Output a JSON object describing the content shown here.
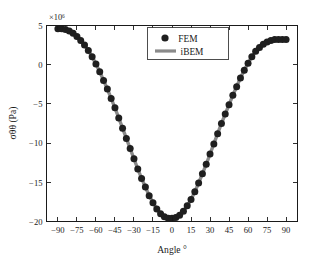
{
  "chart_data": {
    "type": "line",
    "title": "",
    "subtitle": "",
    "xlabel": "Angle °",
    "ylabel": "σθθ (Pa)",
    "y_exponent_label": "×10⁶",
    "y_scale_factor": 1000000,
    "grid": false,
    "legend_position": "upper-center",
    "xlim": [
      -99,
      99
    ],
    "ylim": [
      -20,
      5
    ],
    "xticks": [
      -90,
      -75,
      -60,
      -45,
      -30,
      -15,
      0,
      15,
      30,
      45,
      60,
      75,
      90
    ],
    "xtick_labels": [
      "−90",
      "−75",
      "−60",
      "−45",
      "−30",
      "−15",
      "0",
      "15",
      "30",
      "45",
      "60",
      "75",
      "90"
    ],
    "yticks": [
      5,
      0,
      -5,
      -10,
      -15,
      -20
    ],
    "ytick_labels": [
      "5",
      "0",
      "−5",
      "−10",
      "−15",
      "−20"
    ],
    "series": [
      {
        "name": "FEM",
        "style": "markers",
        "marker": "filled-circle",
        "color": "#1f1f1f",
        "x": [
          -90,
          -87,
          -84,
          -81,
          -78,
          -75,
          -72,
          -69,
          -66,
          -63,
          -60,
          -57,
          -54,
          -51,
          -48,
          -45,
          -42,
          -39,
          -36,
          -33,
          -30,
          -27,
          -24,
          -21,
          -18,
          -15,
          -12,
          -9,
          -6,
          -3,
          0,
          3,
          6,
          9,
          12,
          15,
          18,
          21,
          24,
          27,
          30,
          33,
          36,
          39,
          42,
          45,
          48,
          51,
          54,
          57,
          60,
          63,
          66,
          69,
          72,
          75,
          78,
          81,
          84,
          87,
          90
        ],
        "y": [
          4.6,
          4.6,
          4.5,
          4.3,
          4.0,
          3.6,
          3.1,
          2.5,
          1.8,
          1.0,
          0.1,
          -0.9,
          -2.0,
          -3.1,
          -4.3,
          -5.5,
          -6.8,
          -8.1,
          -9.4,
          -10.7,
          -12.0,
          -13.3,
          -14.5,
          -15.6,
          -16.7,
          -17.6,
          -18.4,
          -19.0,
          -19.4,
          -19.6,
          -19.6,
          -19.5,
          -19.2,
          -18.7,
          -18.0,
          -17.2,
          -16.2,
          -15.1,
          -13.9,
          -12.7,
          -11.4,
          -10.1,
          -8.8,
          -7.5,
          -6.3,
          -5.1,
          -3.9,
          -2.8,
          -1.7,
          -0.7,
          0.2,
          1.0,
          1.7,
          2.2,
          2.6,
          2.9,
          3.1,
          3.2,
          3.2,
          3.2,
          3.2
        ]
      },
      {
        "name": "iBEM",
        "style": "line",
        "color": "#8a8a8a",
        "x": [
          -90,
          -87,
          -84,
          -81,
          -78,
          -75,
          -72,
          -69,
          -66,
          -63,
          -60,
          -57,
          -54,
          -51,
          -48,
          -45,
          -42,
          -39,
          -36,
          -33,
          -30,
          -27,
          -24,
          -21,
          -18,
          -15,
          -12,
          -9,
          -6,
          -3,
          0,
          3,
          6,
          9,
          12,
          15,
          18,
          21,
          24,
          27,
          30,
          33,
          36,
          39,
          42,
          45,
          48,
          51,
          54,
          57,
          60,
          63,
          66,
          69,
          72,
          75,
          78,
          81,
          84,
          87,
          90
        ],
        "y": [
          4.6,
          4.6,
          4.5,
          4.3,
          4.0,
          3.6,
          3.1,
          2.5,
          1.8,
          1.0,
          0.1,
          -0.9,
          -2.0,
          -3.1,
          -4.3,
          -5.5,
          -6.8,
          -8.1,
          -9.4,
          -10.7,
          -12.0,
          -13.3,
          -14.5,
          -15.6,
          -16.7,
          -17.6,
          -18.4,
          -19.0,
          -19.4,
          -19.6,
          -19.6,
          -19.5,
          -19.2,
          -18.7,
          -18.0,
          -17.2,
          -16.2,
          -15.1,
          -13.9,
          -12.7,
          -11.4,
          -10.1,
          -8.8,
          -7.5,
          -6.3,
          -5.1,
          -3.9,
          -2.8,
          -1.7,
          -0.7,
          0.2,
          1.0,
          1.7,
          2.2,
          2.6,
          2.9,
          3.1,
          3.2,
          3.2,
          3.2,
          3.2
        ]
      }
    ],
    "legend_entries": [
      {
        "label": "FEM",
        "marker": "filled-circle",
        "color": "#1f1f1f"
      },
      {
        "label": "iBEM",
        "marker": "line",
        "color": "#8a8a8a"
      }
    ]
  }
}
